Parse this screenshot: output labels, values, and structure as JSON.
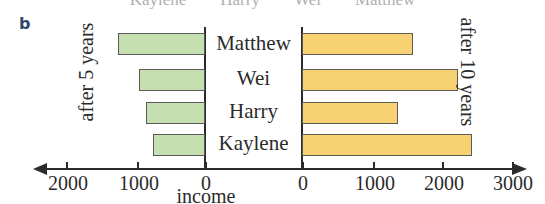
{
  "panel": {
    "letter": "b"
  },
  "clipped_legend": {
    "items": [
      "Kaylene",
      "Harry",
      "Wei",
      "Matthew"
    ]
  },
  "labels": {
    "left_axis": "after 5 years",
    "right_axis": "after 10 years",
    "x_axis_title": "income"
  },
  "colors": {
    "left_bar_fill": "#c5dfb0",
    "right_bar_fill": "#f8d272",
    "bar_stroke": "#5a5a5a",
    "axis": "#2b2b2b",
    "panel_letter": "#2e4a6b"
  },
  "chart_data": {
    "type": "bar",
    "title": "",
    "orientation": "horizontal",
    "style": "back-to-back (bidirectional) bar chart",
    "categories": [
      "Matthew",
      "Wei",
      "Harry",
      "Kaylene"
    ],
    "xlabel": "income",
    "ylabel": "",
    "grid": false,
    "legend_position": "outside-left-and-right-rotated",
    "series": [
      {
        "name": "after 5 years",
        "side": "left",
        "values": [
          1250,
          950,
          850,
          750
        ]
      },
      {
        "name": "after 10 years",
        "side": "right",
        "values": [
          1580,
          2230,
          1370,
          2430
        ]
      }
    ],
    "left_axis": {
      "label": "after 5 years",
      "direction": "right-to-left",
      "ticks": [
        0,
        1000,
        2000
      ],
      "tick_labels": [
        "0",
        "1000",
        "2000"
      ],
      "range": [
        0,
        2400
      ]
    },
    "right_axis": {
      "label": "after 10 years",
      "direction": "left-to-right",
      "ticks": [
        0,
        1000,
        2000,
        3000
      ],
      "tick_labels": [
        "0",
        "1000",
        "2000",
        "3000"
      ],
      "range": [
        0,
        3000
      ]
    },
    "tick_labels_all": [
      "2000",
      "1000",
      "0",
      "0",
      "1000",
      "2000",
      "3000"
    ]
  },
  "geometry": {
    "left_zero_x": 205,
    "right_zero_x": 302,
    "px_per_1000": 70,
    "ticks": [
      {
        "x": 66,
        "label": "2000"
      },
      {
        "x": 137,
        "label": "1000"
      },
      {
        "x": 205,
        "label": "0"
      },
      {
        "x": 302,
        "label": "0"
      },
      {
        "x": 373,
        "label": "1000"
      },
      {
        "x": 442,
        "label": "2000"
      },
      {
        "x": 512,
        "label": "3000"
      }
    ],
    "rows": [
      {
        "top": 33,
        "height": 22
      },
      {
        "top": 69,
        "height": 22
      },
      {
        "top": 102,
        "height": 22
      },
      {
        "top": 134,
        "height": 22
      }
    ],
    "name_tops": [
      33,
      68,
      101,
      133
    ]
  }
}
